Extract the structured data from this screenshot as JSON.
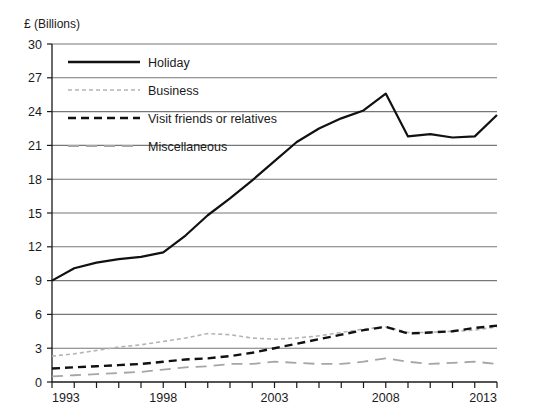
{
  "chart_data": {
    "type": "line",
    "title": "",
    "subtitle": "",
    "xlabel": "",
    "ylabel": "£ (Billions)",
    "ylim": [
      0,
      30
    ],
    "xlim": [
      1993,
      2013
    ],
    "ytick_step": 3,
    "yticks": [
      0,
      3,
      6,
      9,
      12,
      15,
      18,
      21,
      24,
      27,
      30
    ],
    "ytick_labels": [
      "0",
      "3",
      "6",
      "9",
      "12",
      "15",
      "18",
      "21",
      "24",
      "27",
      "30"
    ],
    "xticks": [
      1993,
      1994,
      1995,
      1996,
      1997,
      1998,
      1999,
      2000,
      2001,
      2002,
      2003,
      2004,
      2005,
      2006,
      2007,
      2008,
      2009,
      2010,
      2011,
      2012,
      2013
    ],
    "xtick_labels_shown": [
      "1993",
      "1998",
      "2003",
      "2008",
      "2013"
    ],
    "x": [
      1993,
      1994,
      1995,
      1996,
      1997,
      1998,
      1999,
      2000,
      2001,
      2002,
      2003,
      2004,
      2005,
      2006,
      2007,
      2008,
      2009,
      2010,
      2011,
      2012,
      2013
    ],
    "grid": "horizontal",
    "legend_position": "top-left-inside",
    "series": [
      {
        "name": "Holiday",
        "style": "solid",
        "color": "#111111",
        "width": 2.2,
        "values": [
          9.0,
          10.1,
          10.6,
          10.9,
          11.1,
          11.5,
          13.0,
          14.8,
          16.3,
          17.9,
          19.6,
          21.3,
          22.5,
          23.4,
          24.1,
          25.6,
          21.8,
          22.0,
          21.7,
          21.8,
          23.7
        ]
      },
      {
        "name": "Business",
        "style": "fine-dashed",
        "color": "#b4b4b4",
        "width": 1.6,
        "values": [
          2.3,
          2.5,
          2.8,
          3.1,
          3.3,
          3.6,
          3.9,
          4.3,
          4.2,
          3.9,
          3.8,
          3.9,
          4.1,
          4.4,
          4.7,
          4.9,
          4.4,
          4.4,
          4.5,
          4.6,
          4.9
        ]
      },
      {
        "name": "Visit friends or relatives",
        "style": "dashed",
        "color": "#111111",
        "width": 2.4,
        "values": [
          1.2,
          1.3,
          1.4,
          1.5,
          1.6,
          1.8,
          2.0,
          2.1,
          2.3,
          2.6,
          3.0,
          3.4,
          3.8,
          4.2,
          4.6,
          4.9,
          4.3,
          4.4,
          4.5,
          4.8,
          5.0
        ]
      },
      {
        "name": "Miscellaneous",
        "style": "long-dashed",
        "color": "#a6a6a6",
        "width": 1.8,
        "values": [
          0.5,
          0.6,
          0.7,
          0.8,
          0.9,
          1.1,
          1.3,
          1.4,
          1.6,
          1.6,
          1.8,
          1.7,
          1.6,
          1.6,
          1.8,
          2.1,
          1.8,
          1.6,
          1.7,
          1.8,
          1.6
        ]
      }
    ],
    "legend": [
      {
        "label": "Holiday",
        "style": "solid",
        "color": "#111111"
      },
      {
        "label": "Business",
        "style": "fine-dashed",
        "color": "#b4b4b4"
      },
      {
        "label": "Visit friends or relatives",
        "style": "dashed",
        "color": "#111111"
      },
      {
        "label": "Miscellaneous",
        "style": "long-dashed",
        "color": "#a6a6a6"
      }
    ],
    "colors": {
      "gridline": "#777777",
      "axis": "#1a1a1a",
      "text": "#1a1a1a",
      "background": "#ffffff"
    }
  }
}
